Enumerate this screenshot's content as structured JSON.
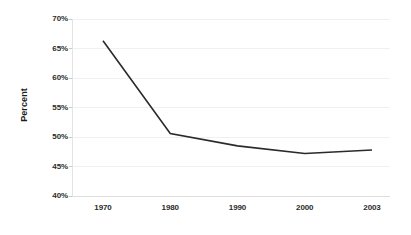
{
  "chart_data": {
    "type": "line",
    "title": "",
    "subtitle": "",
    "xlabel": "",
    "ylabel": "Percent",
    "categories": [
      "1970",
      "1980",
      "1990",
      "2000",
      "2003"
    ],
    "x": [
      1970,
      1980,
      1990,
      2000,
      2003
    ],
    "values": [
      66.3,
      50.6,
      48.5,
      47.2,
      47.8
    ],
    "series": [
      {
        "name": "Percent",
        "values": [
          66.3,
          50.6,
          48.5,
          47.2,
          47.8
        ],
        "color": "#2a2a2a"
      }
    ],
    "ylim": [
      40,
      70
    ],
    "ytick_step": 5,
    "ytick_labels": [
      "70%",
      "65%",
      "60%",
      "55%",
      "50%",
      "45%",
      "40%"
    ],
    "ytick_values": [
      70,
      65,
      60,
      55,
      50,
      45,
      40
    ],
    "xtick_labels": [
      "1970",
      "1980",
      "1990",
      "2000",
      "2003"
    ],
    "grid": true,
    "grid_axis": "y",
    "grid_color": "#f0f0f0",
    "axis_line_color": "#e3e3e3",
    "legend": false,
    "legend_position": "none",
    "markers": false,
    "background_color": "#ffffff",
    "line_width": 1.6,
    "annotations": []
  },
  "axes": {
    "y_title": "Percent"
  }
}
